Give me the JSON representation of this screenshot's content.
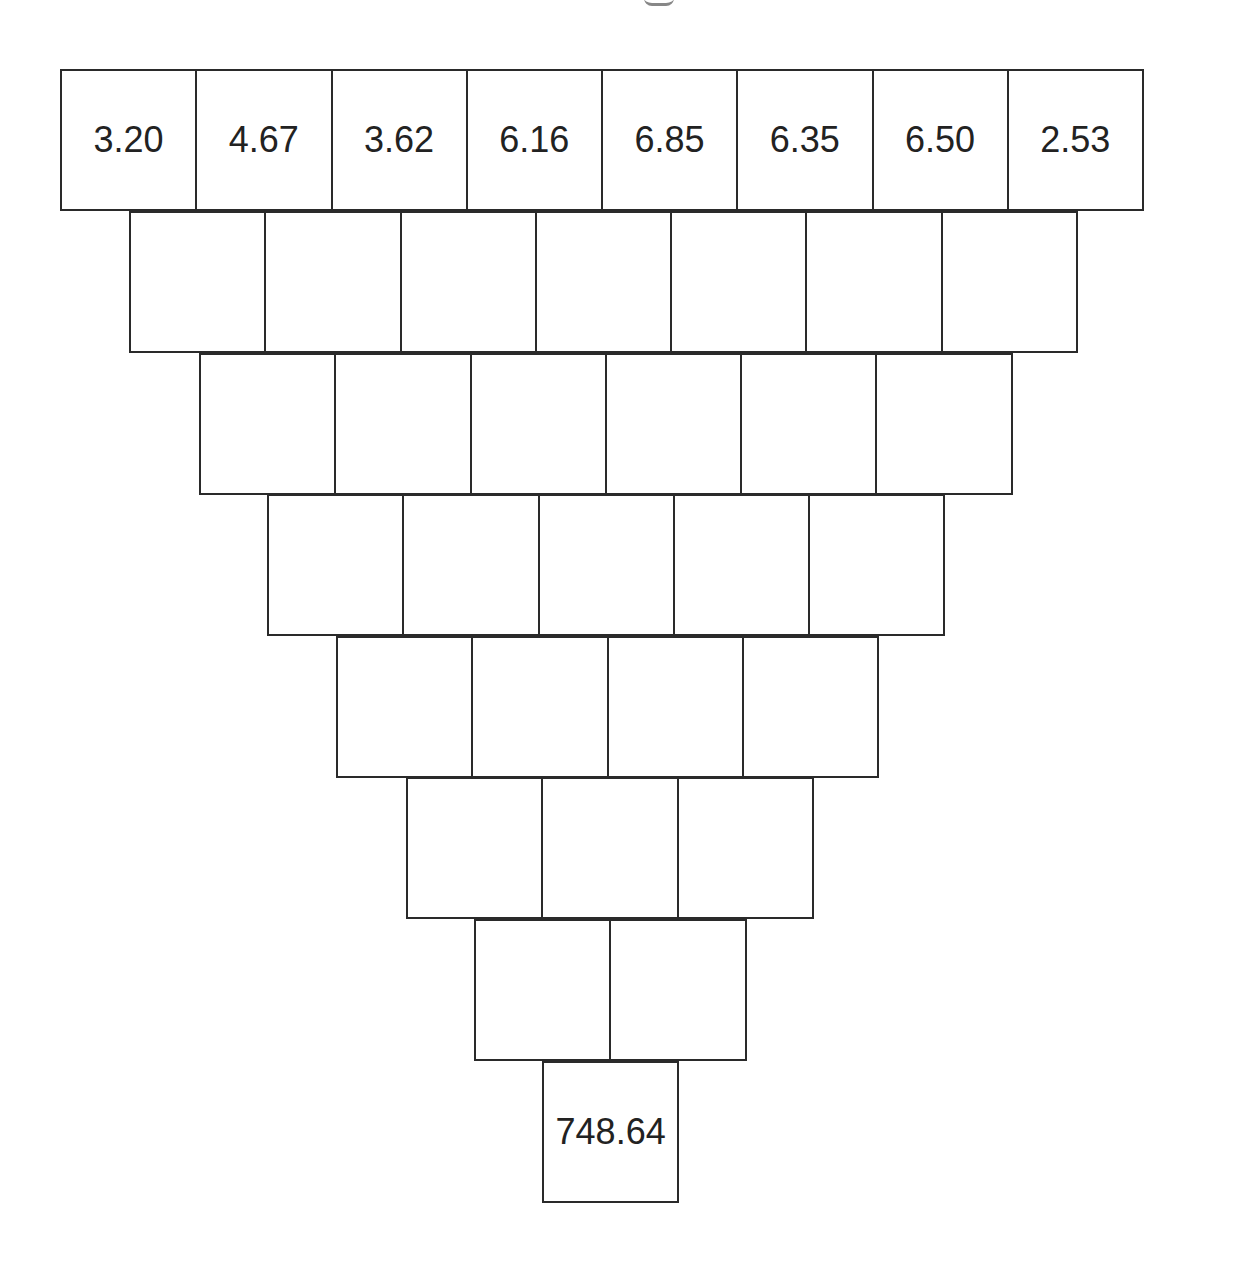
{
  "diagram": {
    "type": "number-pyramid (inverted)",
    "title_visible": false,
    "rows": [
      [
        "3.20",
        "4.67",
        "3.62",
        "6.16",
        "6.85",
        "6.35",
        "6.50",
        "2.53"
      ],
      [
        "",
        "",
        "",
        "",
        "",
        "",
        ""
      ],
      [
        "",
        "",
        "",
        "",
        "",
        ""
      ],
      [
        "",
        "",
        "",
        "",
        ""
      ],
      [
        "",
        "",
        "",
        ""
      ],
      [
        "",
        "",
        ""
      ],
      [
        "",
        ""
      ],
      [
        "748.64"
      ]
    ]
  },
  "chart_data": {
    "type": "table",
    "title": "",
    "top_row": [
      3.2,
      4.67,
      3.62,
      6.16,
      6.85,
      6.35,
      6.5,
      2.53
    ],
    "bottom_value": 748.64,
    "row_counts": [
      8,
      7,
      6,
      5,
      4,
      3,
      2,
      1
    ]
  }
}
